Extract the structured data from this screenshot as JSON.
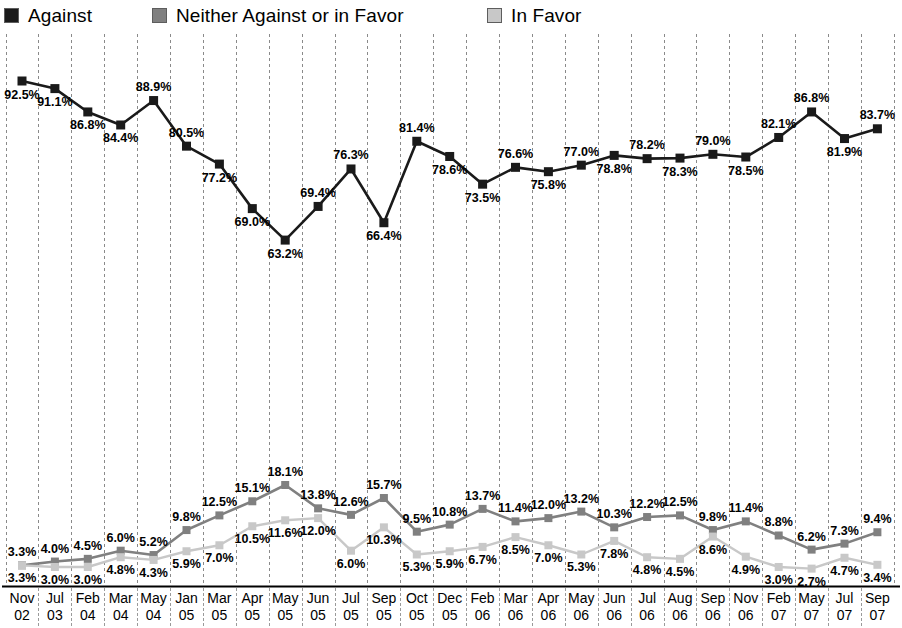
{
  "legend": {
    "items": [
      {
        "label": "Against",
        "color": "#1a1a1a",
        "name": "legend-item-against"
      },
      {
        "label": "Neither Against or in Favor",
        "color": "#808080",
        "name": "legend-item-neither"
      },
      {
        "label": "In Favor",
        "color": "#c8c8c8",
        "name": "legend-item-in-favor"
      }
    ]
  },
  "chart_data": {
    "type": "line",
    "title": "",
    "subtitle": "",
    "xlabel": "",
    "ylabel": "",
    "ylim": [
      0,
      100
    ],
    "grid": "vertical-dashed",
    "legend_position": "top-left",
    "value_labels": true,
    "value_suffix": "%",
    "categories": [
      "Nov 02",
      "Jul 03",
      "Feb 04",
      "Mar 04",
      "May 04",
      "Jan 05",
      "Mar 05",
      "Apr 05",
      "May 05",
      "Jun 05",
      "Jul 05",
      "Sep 05",
      "Oct 05",
      "Dec 05",
      "Feb 06",
      "Mar 06",
      "Apr 06",
      "May 06",
      "Jun 06",
      "Jul 06",
      "Aug 06",
      "Sep 06",
      "Nov 06",
      "Feb 07",
      "May 07",
      "Jul 07",
      "Sep 07"
    ],
    "categories_month": [
      "Nov",
      "Jul",
      "Feb",
      "Mar",
      "May",
      "Jan",
      "Mar",
      "Apr",
      "May",
      "Jun",
      "Jul",
      "Sep",
      "Oct",
      "Dec",
      "Feb",
      "Mar",
      "Apr",
      "May",
      "Jun",
      "Jul",
      "Aug",
      "Sep",
      "Nov",
      "Feb",
      "May",
      "Jul",
      "Sep"
    ],
    "categories_year": [
      "02",
      "03",
      "04",
      "04",
      "04",
      "05",
      "05",
      "05",
      "05",
      "05",
      "05",
      "05",
      "05",
      "05",
      "06",
      "06",
      "06",
      "06",
      "06",
      "06",
      "06",
      "06",
      "06",
      "07",
      "07",
      "07",
      "07"
    ],
    "series": [
      {
        "name": "Against",
        "color": "#1a1a1a",
        "values": [
          92.5,
          91.1,
          86.8,
          84.4,
          88.9,
          80.5,
          77.2,
          69.0,
          63.2,
          69.4,
          76.3,
          66.4,
          81.4,
          78.6,
          73.5,
          76.6,
          75.8,
          77.0,
          78.8,
          78.2,
          78.3,
          79.0,
          78.5,
          82.1,
          86.8,
          81.9,
          83.7
        ],
        "label_positions": [
          "below",
          "below",
          "below",
          "below",
          "above",
          "above",
          "below",
          "below",
          "below",
          "above",
          "above",
          "below",
          "above",
          "below",
          "below",
          "above",
          "below",
          "above",
          "below",
          "above",
          "below",
          "above",
          "below",
          "above",
          "above",
          "below",
          "above"
        ]
      },
      {
        "name": "Neither Against or in Favor",
        "color": "#808080",
        "values": [
          3.3,
          4.0,
          4.5,
          6.0,
          5.2,
          9.8,
          12.5,
          15.1,
          18.1,
          13.8,
          12.6,
          15.7,
          9.5,
          10.8,
          13.7,
          11.4,
          12.0,
          13.2,
          10.3,
          12.2,
          12.5,
          9.8,
          11.4,
          8.8,
          6.2,
          7.3,
          9.4
        ],
        "label_positions": [
          "above",
          "above",
          "above",
          "above",
          "above",
          "above",
          "above",
          "above",
          "above",
          "above",
          "above",
          "above",
          "above",
          "above",
          "above",
          "above",
          "above",
          "above",
          "above",
          "above",
          "above",
          "above",
          "above",
          "above",
          "above",
          "above",
          "above"
        ]
      },
      {
        "name": "In Favor",
        "color": "#c8c8c8",
        "values": [
          3.3,
          3.0,
          3.0,
          4.8,
          4.3,
          5.9,
          7.0,
          10.5,
          11.6,
          12.0,
          6.0,
          10.3,
          5.3,
          5.9,
          6.7,
          8.5,
          7.0,
          5.3,
          7.8,
          4.8,
          4.5,
          8.6,
          4.9,
          3.0,
          2.7,
          4.7,
          3.4
        ],
        "label_positions": [
          "below",
          "below",
          "below",
          "below",
          "below",
          "below",
          "below",
          "below",
          "below",
          "below",
          "below",
          "below",
          "below",
          "below",
          "below",
          "below",
          "below",
          "below",
          "below",
          "below",
          "below",
          "below",
          "below",
          "below",
          "below",
          "below",
          "below"
        ]
      }
    ]
  }
}
